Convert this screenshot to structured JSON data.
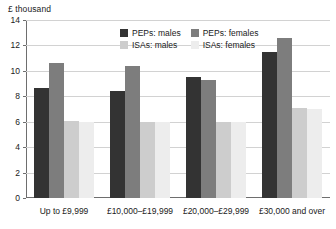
{
  "units_caption": "£ thousand",
  "legend": {
    "entries": [
      {
        "label": "PEPs: males",
        "color": "#333333",
        "icon": "legend-swatch-icon"
      },
      {
        "label": "PEPs: females",
        "color": "#7d7d7d",
        "icon": "legend-swatch-icon"
      },
      {
        "label": "ISAs: males",
        "color": "#cdcdcd",
        "icon": "legend-swatch-icon"
      },
      {
        "label": "ISAs: females",
        "color": "#ededed",
        "icon": "legend-swatch-icon"
      }
    ]
  },
  "chart_data": {
    "type": "bar",
    "title": "",
    "subtitle": "",
    "xlabel": "",
    "ylabel": "£ thousand",
    "ylim": [
      0,
      14
    ],
    "yticks": [
      0,
      2,
      4,
      6,
      8,
      10,
      12,
      14
    ],
    "ytick_labels": [
      "0",
      "2",
      "4",
      "6",
      "8",
      "10",
      "12",
      "14"
    ],
    "grid": true,
    "grid_axis": "y",
    "legend_position": "top-center",
    "categories": [
      "Up to £9,999",
      "£10,000–£19,999",
      "£20,000–£29,999",
      "£30,000 and over"
    ],
    "series": [
      {
        "name": "PEPs: males",
        "color": "#333333",
        "values": [
          8.65,
          8.45,
          9.5,
          11.45
        ]
      },
      {
        "name": "PEPs: females",
        "color": "#7d7d7d",
        "values": [
          10.6,
          10.35,
          9.3,
          12.6
        ]
      },
      {
        "name": "ISAs: males",
        "color": "#cdcdcd",
        "values": [
          6.05,
          6.0,
          6.0,
          7.05
        ]
      },
      {
        "name": "ISAs: females",
        "color": "#ededed",
        "values": [
          6.0,
          5.95,
          6.0,
          7.0
        ]
      }
    ]
  }
}
